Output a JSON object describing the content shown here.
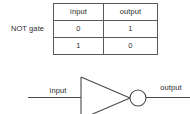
{
  "figure": {
    "gate_name": "NOT gate",
    "background_color": "#ffffff",
    "line_color": "#4a4a4a",
    "text_color": "#2b2b2b",
    "table_border_color": "#595959"
  },
  "truth_table": {
    "headers": [
      "input",
      "output"
    ],
    "rows": [
      [
        "0",
        "1"
      ],
      [
        "1",
        "0"
      ]
    ]
  },
  "symbol": {
    "input_label": "input",
    "output_label": "output",
    "shape": "inverter-triangle-with-bubble"
  }
}
